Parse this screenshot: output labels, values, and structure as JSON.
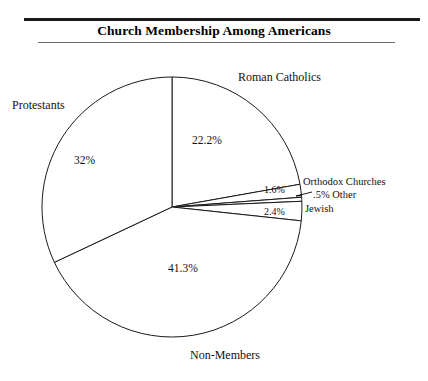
{
  "header": {
    "title": "Church Membership Among Americans",
    "ghost_clipped_text": "",
    "rule_color": "#1a1a1a",
    "rule_thin_color": "#6e6e6e"
  },
  "chart_data": {
    "type": "pie",
    "title": "Church Membership Among Americans",
    "xlabel": "",
    "ylabel": "",
    "legend_position": "callout-labels",
    "grid": false,
    "categories": [
      "Roman Catholics",
      "Orthodox Churches",
      "Other",
      "Jewish",
      "Non-Members",
      "Protestants"
    ],
    "values": [
      22.2,
      1.6,
      0.5,
      2.4,
      41.3,
      32
    ],
    "value_labels": [
      "22.2%",
      "1.6%",
      ".5%",
      "2.4%",
      "41.3%",
      "32%"
    ],
    "units": "percent",
    "start_angle_deg": 0,
    "direction": "clockwise",
    "slice_fill": "#ffffff",
    "slice_stroke": "#1a1a1a",
    "slices": [
      {
        "name": "Roman Catholics",
        "value": 22.2,
        "value_label": "22.2%",
        "category_label": "Roman Catholics",
        "label_placement": "outside-right-top"
      },
      {
        "name": "Orthodox Churches",
        "value": 1.6,
        "value_label": "1.6%",
        "category_label": "Orthodox Churches",
        "label_placement": "outside-right"
      },
      {
        "name": "Other",
        "value": 0.5,
        "value_label": ".5%",
        "category_label": ".5% Other",
        "label_placement": "outside-right-leader"
      },
      {
        "name": "Jewish",
        "value": 2.4,
        "value_label": "2.4%",
        "category_label": "Jewish",
        "label_placement": "outside-right"
      },
      {
        "name": "Non-Members",
        "value": 41.3,
        "value_label": "41.3%",
        "category_label": "Non-Members",
        "label_placement": "outside-bottom"
      },
      {
        "name": "Protestants",
        "value": 32,
        "value_label": "32%",
        "category_label": "Protestants",
        "label_placement": "outside-left-top"
      }
    ]
  }
}
